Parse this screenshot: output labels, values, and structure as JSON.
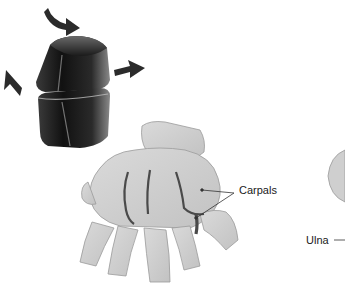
{
  "figure": {
    "colors": {
      "background": "#ffffff",
      "block_dark": "#1c1c1c",
      "block_highlight": "#e8e8e8",
      "arrow": "#2b2b2b",
      "bone_fill": "#cfcfcf",
      "bone_outline": "#9a9a9a",
      "joint_line": "#4a4a4a",
      "leader_line": "#333333"
    },
    "joint_model": {
      "name": "gliding joint model",
      "arrows": [
        "rotation-arrow-top",
        "arrow-left-up",
        "arrow-right"
      ]
    },
    "labels": {
      "carpals": "Carpals",
      "ulna": "Ulna"
    }
  }
}
